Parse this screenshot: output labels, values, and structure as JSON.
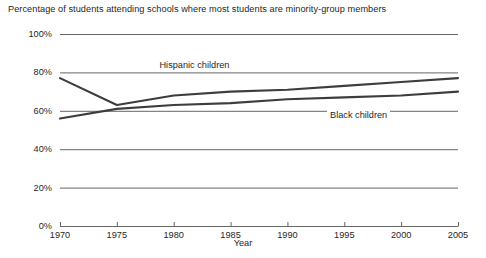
{
  "chart_data": {
    "type": "line",
    "title": "Percentage of students attending schools where most students are minority-group members",
    "xlabel": "Year",
    "ylabel": "",
    "x": [
      1970,
      1975,
      1980,
      1985,
      1990,
      1995,
      2000,
      2005
    ],
    "xlim": [
      1970,
      2005
    ],
    "ylim": [
      0,
      100
    ],
    "xticks": [
      "1970",
      "1975",
      "1980",
      "1985",
      "1990",
      "1995",
      "2000",
      "2005"
    ],
    "yticks": [
      "0%",
      "20%",
      "40%",
      "60%",
      "80%",
      "100%"
    ],
    "grid": true,
    "legend_position": "inline-labels",
    "series": [
      {
        "name": "Hispanic children",
        "color": "#3d3d3d",
        "values": [
          77,
          63,
          68,
          70,
          71,
          73,
          75,
          77
        ],
        "label_x": 1982,
        "label_y": 84
      },
      {
        "name": "Black children",
        "color": "#3d3d3d",
        "values": [
          56,
          61,
          63,
          64,
          66,
          67,
          68,
          70
        ],
        "label_x": 1997,
        "label_y": 58
      }
    ]
  },
  "axes": {
    "x_title": "Year"
  }
}
